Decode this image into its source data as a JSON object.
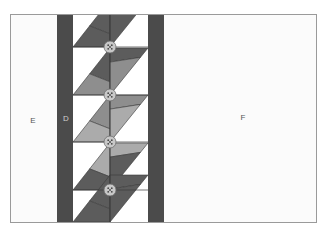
{
  "diagram": {
    "type": "quilt-layout",
    "labels": {
      "E": "E",
      "D": "D",
      "F": "F"
    },
    "colors": {
      "border": "#9a9a9a",
      "panel": "#fbfbfb",
      "dark_column": "#4b4b4b",
      "dark_patch": "#5c5c5c",
      "medium_patch": "#8e8e8e",
      "light_patch": "#ababab",
      "button_fill": "#c8c8c8",
      "button_stroke": "#6e6e6e",
      "white_patch": "#ffffff",
      "seam": "#3a3a3a"
    },
    "bands": [
      {
        "y0": 14,
        "y1": 47,
        "left_upper": "dark",
        "left_lower": "dark",
        "right_upper": "dark",
        "right_lower": "dark"
      },
      {
        "y0": 47,
        "y1": 95,
        "left_upper": "dark",
        "left_lower": "medium",
        "right_upper": "dark",
        "right_lower": "medium"
      },
      {
        "y0": 95,
        "y1": 142,
        "left_upper": "medium",
        "left_lower": "light",
        "right_upper": "medium",
        "right_lower": "light"
      },
      {
        "y0": 142,
        "y1": 190,
        "left_upper": "light",
        "left_lower": "dark",
        "right_upper": "light",
        "right_lower": "dark"
      },
      {
        "y0": 190,
        "y1": 222,
        "left_upper": "dark",
        "left_lower": "dark",
        "right_upper": "dark",
        "right_lower": "dark"
      }
    ],
    "buttons": [
      {
        "cx": 110,
        "cy": 47
      },
      {
        "cx": 110,
        "cy": 95
      },
      {
        "cx": 110,
        "cy": 142
      },
      {
        "cx": 110,
        "cy": 190
      }
    ]
  }
}
